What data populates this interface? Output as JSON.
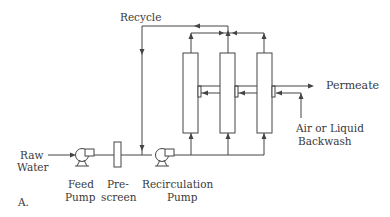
{
  "diagram": {
    "labels": {
      "recycle": "Recycle",
      "permeate": "Permeate",
      "backwash_line1": "Air or Liquid",
      "backwash_line2": "Backwash",
      "raw_water_line1": "Raw",
      "raw_water_line2": "Water",
      "feed_pump_line1": "Feed",
      "feed_pump_line2": "Pump",
      "prescreen_line1": "Pre-",
      "prescreen_line2": "screen",
      "recirc_pump_line1": "Recirculation",
      "recirc_pump_line2": "Pump",
      "panel": "A."
    },
    "components": [
      {
        "id": "feed-pump",
        "type": "pump"
      },
      {
        "id": "prescreen",
        "type": "filter"
      },
      {
        "id": "recirculation-pump",
        "type": "pump"
      },
      {
        "id": "membrane-module-1",
        "type": "membrane-module"
      },
      {
        "id": "membrane-module-2",
        "type": "membrane-module"
      },
      {
        "id": "membrane-module-3",
        "type": "membrane-module"
      }
    ],
    "colors": {
      "line": "#444444",
      "text": "#3a3a3a",
      "background": "#ffffff"
    }
  }
}
